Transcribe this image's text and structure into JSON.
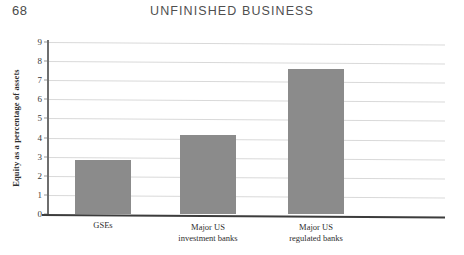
{
  "page": {
    "number": "68",
    "running_head": "UNFINISHED BUSINESS"
  },
  "chart_data": {
    "type": "bar",
    "title": "",
    "xlabel": "",
    "ylabel": "Equity as a percentage of assets",
    "categories": [
      "GSEs",
      "Major US investment banks",
      "Major US regulated banks"
    ],
    "category_lines": [
      [
        "GSEs"
      ],
      [
        "Major US",
        "investment banks"
      ],
      [
        "Major US",
        "regulated banks"
      ]
    ],
    "values": [
      2.85,
      4.15,
      7.6
    ],
    "ylim": [
      0,
      9
    ],
    "ytick_labels": [
      "0",
      "1",
      "2",
      "3",
      "4",
      "5",
      "6",
      "7",
      "8",
      "9"
    ],
    "ytick_values": [
      0,
      1,
      2,
      3,
      4,
      5,
      6,
      7,
      8,
      9
    ],
    "grid": true,
    "legend": "none",
    "bar_color": "#8b8b8b",
    "gridline_color": "#d9d9d9",
    "axis_color": "#3c3c3c"
  }
}
